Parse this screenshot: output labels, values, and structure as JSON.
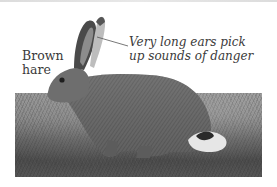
{
  "figure": {
    "labels": {
      "species_line1": "Brown",
      "species_line2": "hare",
      "annotation_line1": "Very long ears pick",
      "annotation_line2": "up sounds of danger"
    },
    "colors": {
      "text": "#3a3a3a",
      "background": "#ffffff",
      "leader_line": "#555555"
    }
  }
}
